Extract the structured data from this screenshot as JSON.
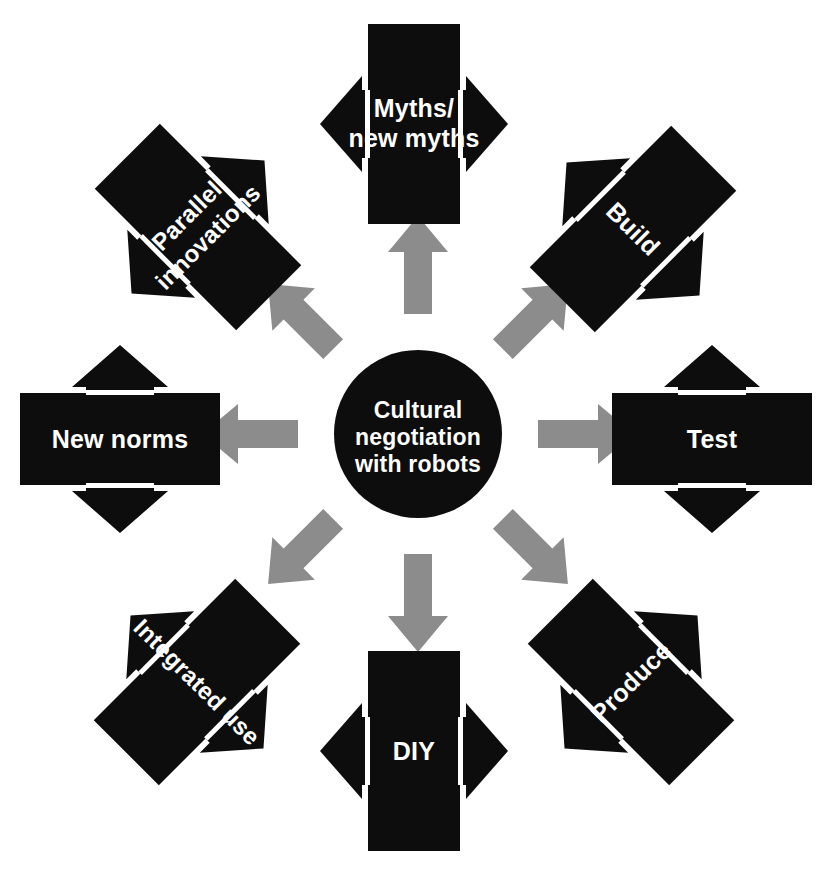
{
  "diagram": {
    "title": "Cultural negotiation with robots",
    "type": "radial-cycle",
    "background_color": "#ffffff",
    "node_color": "#0d0d0d",
    "node_text_color": "#ffffff",
    "radial_arrow_color": "#8c8c8c",
    "hub": {
      "name": "cultural-negotiation-hub",
      "lines": [
        "Cultural",
        "negotiation",
        "with robots"
      ],
      "shape": "circle"
    },
    "nodes": [
      {
        "id": "myths",
        "position": "top",
        "angle_deg": 0,
        "rotation_deg": 0,
        "shape": "bar-with-double-arrow",
        "lines": [
          "Myths/",
          "new myths"
        ]
      },
      {
        "id": "build",
        "position": "top-right",
        "angle_deg": 45,
        "rotation_deg": 45,
        "shape": "bar-with-double-arrow",
        "lines": [
          "Build"
        ]
      },
      {
        "id": "test",
        "position": "right",
        "angle_deg": 90,
        "rotation_deg": 90,
        "shape": "bar-with-double-arrow",
        "lines": [
          "Test"
        ]
      },
      {
        "id": "produce",
        "position": "bottom-right",
        "angle_deg": 135,
        "rotation_deg": 135,
        "shape": "bar-with-double-arrow",
        "lines": [
          "Produce"
        ]
      },
      {
        "id": "diy",
        "position": "bottom",
        "angle_deg": 180,
        "rotation_deg": 180,
        "shape": "bar-with-double-arrow",
        "lines": [
          "DIY"
        ]
      },
      {
        "id": "integrated-use",
        "position": "bottom-left",
        "angle_deg": 225,
        "rotation_deg": 225,
        "shape": "bar-with-double-arrow",
        "lines": [
          "Integrated use"
        ]
      },
      {
        "id": "new-norms",
        "position": "left",
        "angle_deg": 270,
        "rotation_deg": 270,
        "shape": "bar-with-double-arrow",
        "lines": [
          "New norms"
        ]
      },
      {
        "id": "parallel-innovations",
        "position": "top-left",
        "angle_deg": 315,
        "rotation_deg": 315,
        "shape": "bar-with-double-arrow",
        "lines": [
          "Parallel",
          "innovations"
        ]
      }
    ],
    "radial_arrows": [
      {
        "id": "arrow-to-myths",
        "direction": "up",
        "target": "myths"
      },
      {
        "id": "arrow-to-build",
        "direction": "up-right",
        "target": "build"
      },
      {
        "id": "arrow-to-test",
        "direction": "right",
        "target": "test"
      },
      {
        "id": "arrow-to-produce",
        "direction": "down-right",
        "target": "produce"
      },
      {
        "id": "arrow-to-diy",
        "direction": "down",
        "target": "diy"
      },
      {
        "id": "arrow-to-integrated-use",
        "direction": "down-left",
        "target": "integrated-use"
      },
      {
        "id": "arrow-to-new-norms",
        "direction": "left",
        "target": "new-norms"
      },
      {
        "id": "arrow-to-parallel-innovations",
        "direction": "up-left",
        "target": "parallel-innovations"
      }
    ]
  }
}
